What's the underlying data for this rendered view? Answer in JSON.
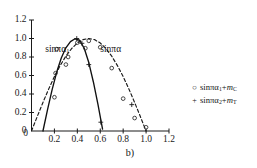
{
  "chart_data": {
    "type": "scatter",
    "title": "",
    "subtitle": "",
    "caption": "b)",
    "xlabel": "",
    "ylabel": "",
    "xlim": [
      0,
      1.2
    ],
    "ylim": [
      0,
      1.2
    ],
    "grid": false,
    "legend_position": "right",
    "x_ticks": [
      "0",
      "0.2",
      "0.4",
      "0.6",
      "0.8",
      "1.0",
      "1.2"
    ],
    "x_tick_values": [
      0,
      0.2,
      0.4,
      0.6,
      0.8,
      1.0,
      1.2
    ],
    "y_ticks": [
      "0",
      "0.2",
      "0.4",
      "0.6",
      "0.8",
      "1.0",
      "1.2"
    ],
    "y_tick_values": [
      0,
      0.2,
      0.4,
      0.6,
      0.8,
      1.0,
      1.2
    ],
    "annotations": [
      {
        "text": "sinπα",
        "sub": "1",
        "x": 0.12,
        "y": 0.88,
        "name": "curve-label-sin-pi-alpha-1"
      },
      {
        "text": "sinπα",
        "sub": "",
        "x": 0.6,
        "y": 0.88,
        "name": "curve-label-sin-pi-alpha"
      }
    ],
    "legend": [
      {
        "marker": "circle",
        "glyph": "○",
        "text": "sinπα",
        "sub": "1",
        "suffix": "+",
        "italic_term": "m",
        "italic_sub": "C"
      },
      {
        "marker": "plus",
        "glyph": "+",
        "text": "sinπα",
        "sub": "2",
        "suffix": "+",
        "italic_term": "m",
        "italic_sub": "T"
      }
    ],
    "series": [
      {
        "name": "sinπα (dashed curve)",
        "style": "dashed",
        "color": "#1a1a1a",
        "x": [
          0.0,
          0.05,
          0.1,
          0.15,
          0.2,
          0.25,
          0.3,
          0.35,
          0.4,
          0.45,
          0.5,
          0.55,
          0.6,
          0.65,
          0.7,
          0.75,
          0.8,
          0.85,
          0.9,
          0.95,
          1.0
        ],
        "y": [
          0.0,
          0.156,
          0.309,
          0.454,
          0.588,
          0.707,
          0.809,
          0.891,
          0.951,
          0.988,
          1.0,
          0.988,
          0.951,
          0.891,
          0.809,
          0.707,
          0.588,
          0.454,
          0.309,
          0.156,
          0.0
        ]
      },
      {
        "name": "sinπα₁ (solid curve)",
        "style": "solid",
        "color": "#101010",
        "x": [
          0.1,
          0.14,
          0.18,
          0.22,
          0.26,
          0.3,
          0.34,
          0.38,
          0.42,
          0.46,
          0.5,
          0.54,
          0.58,
          0.62
        ],
        "y": [
          0.0,
          0.232,
          0.448,
          0.637,
          0.79,
          0.899,
          0.966,
          0.997,
          0.981,
          0.894,
          0.74,
          0.53,
          0.288,
          0.02
        ]
      }
    ],
    "points": [
      {
        "marker": "circle",
        "x": 0.2,
        "y": 0.365
      },
      {
        "marker": "circle",
        "x": 0.21,
        "y": 0.625
      },
      {
        "marker": "circle",
        "x": 0.22,
        "y": 0.885
      },
      {
        "marker": "circle",
        "x": 0.3,
        "y": 0.718
      },
      {
        "marker": "circle",
        "x": 0.32,
        "y": 0.8
      },
      {
        "marker": "circle",
        "x": 0.4,
        "y": 0.955
      },
      {
        "marker": "circle",
        "x": 0.47,
        "y": 0.895
      },
      {
        "marker": "circle",
        "x": 0.5,
        "y": 0.975
      },
      {
        "marker": "circle",
        "x": 0.6,
        "y": 0.905
      },
      {
        "marker": "circle",
        "x": 0.7,
        "y": 0.68
      },
      {
        "marker": "circle",
        "x": 0.8,
        "y": 0.35
      },
      {
        "marker": "circle",
        "x": 0.9,
        "y": 0.14
      },
      {
        "marker": "circle",
        "x": 1.0,
        "y": 0.04
      },
      {
        "marker": "plus",
        "x": 0.395,
        "y": 1.0
      },
      {
        "marker": "plus",
        "x": 0.44,
        "y": 0.948
      },
      {
        "marker": "plus",
        "x": 0.5,
        "y": 0.718
      },
      {
        "marker": "plus",
        "x": 0.605,
        "y": 0.095
      },
      {
        "marker": "plus",
        "x": 0.875,
        "y": 0.285
      }
    ]
  }
}
